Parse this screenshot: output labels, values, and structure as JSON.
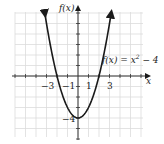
{
  "chart_data": {
    "type": "line",
    "title": "",
    "function_label": "f(x) = x² − 4",
    "xlabel": "x",
    "ylabel": "f(x)",
    "xlim": [
      -6,
      6
    ],
    "ylim": [
      -6,
      6
    ],
    "grid": true,
    "x_tick_labels": [
      "−3",
      "−1",
      "1",
      "3"
    ],
    "x_tick_values": [
      -3,
      -1,
      1,
      3
    ],
    "y_tick_labels": [
      "−4"
    ],
    "y_tick_values": [
      -4
    ],
    "series": [
      {
        "name": "f(x) = x^2 - 4",
        "x": [
          -3.2,
          -3,
          -2,
          -1,
          0,
          1,
          2,
          3,
          3.2
        ],
        "values": [
          6.24,
          5,
          0,
          -3,
          -4,
          -3,
          0,
          5,
          6.24
        ]
      }
    ],
    "colors": {
      "curve": "#1a1a1a",
      "grid": "#d9d9d9",
      "axes": "#333333"
    }
  },
  "labels": {
    "ylabel": "f(x)",
    "xlabel": "x",
    "function": "f(x) = x",
    "exponent": "2",
    "function_tail": " − 4",
    "xm3": "−3",
    "xm1": "−1",
    "x1": "1",
    "x3": "3",
    "ym4": "−4"
  }
}
